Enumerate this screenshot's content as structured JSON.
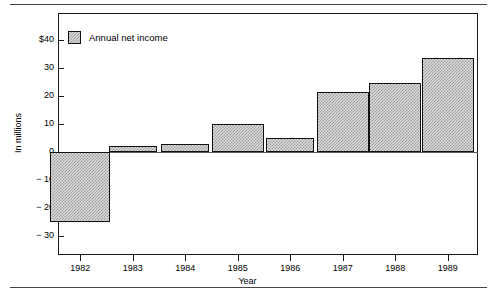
{
  "chart_data": {
    "type": "bar",
    "title": "",
    "subtitle": "",
    "xlabel": "Year",
    "ylabel": "In millions",
    "categories": [
      "1982",
      "1983",
      "1984",
      "1985",
      "1986",
      "1987",
      "1988",
      "1989"
    ],
    "values": [
      -25,
      2,
      3,
      10,
      5,
      21.5,
      24.5,
      33.5
    ],
    "series": [
      {
        "name": "Annual net income",
        "values": [
          -25,
          2,
          3,
          10,
          5,
          21.5,
          24.5,
          33.5
        ]
      }
    ],
    "ylim": [
      -35,
      45
    ],
    "yticks": [
      40,
      30,
      20,
      10,
      0,
      -10,
      -20,
      -30
    ],
    "ytick_labels": [
      "$40",
      "30",
      "20",
      "10",
      "0",
      "− 10",
      "− 20",
      "− 30"
    ],
    "grid": false,
    "legend_position": "top-left",
    "legend_entries": [
      "Annual net income"
    ],
    "zero_line": true,
    "bar_fill": "#dcdcdc",
    "bar_pattern": "checkerboard",
    "bar_border": "#111111",
    "frame_color": "#1a1a1a",
    "background": "#ffffff"
  },
  "legend": {
    "label": "Annual net income"
  },
  "axes": {
    "x_title": "Year",
    "y_title": "In millions"
  }
}
